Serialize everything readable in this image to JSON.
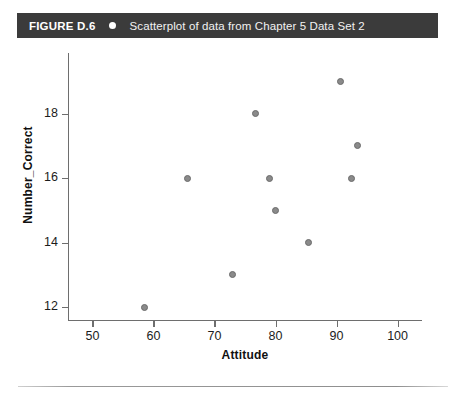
{
  "caption": {
    "figure_number": "FIGURE D.6",
    "bullet": "bullet-icon",
    "text": "Scatterplot of data from Chapter 5 Data Set 2",
    "bar_color": "#3b3b3b",
    "text_color": "#ffffff"
  },
  "chart_data": {
    "type": "scatter",
    "title": "Scatterplot of data from Chapter 5 Data Set 2",
    "xlabel": "Attitude",
    "ylabel": "Number_Correct",
    "xlim": [
      46,
      104
    ],
    "ylim": [
      11.6,
      19.6
    ],
    "xticks": [
      50,
      60,
      70,
      80,
      90,
      100
    ],
    "yticks": [
      12,
      14,
      16,
      18
    ],
    "xtick_labels": [
      "50",
      "60",
      "70",
      "80",
      "90",
      "100"
    ],
    "ytick_labels": [
      "12",
      "14",
      "16",
      "18"
    ],
    "grid": false,
    "legend": false,
    "marker_color": "#8a8a8a",
    "marker_edge_color": "#6b6b6b",
    "points": [
      {
        "x": 58.5,
        "y": 12
      },
      {
        "x": 65.5,
        "y": 16
      },
      {
        "x": 73,
        "y": 13
      },
      {
        "x": 76.7,
        "y": 18
      },
      {
        "x": 79,
        "y": 16
      },
      {
        "x": 80,
        "y": 15
      },
      {
        "x": 85.4,
        "y": 14
      },
      {
        "x": 90.7,
        "y": 19
      },
      {
        "x": 92.5,
        "y": 16
      },
      {
        "x": 93.5,
        "y": 17
      }
    ]
  }
}
